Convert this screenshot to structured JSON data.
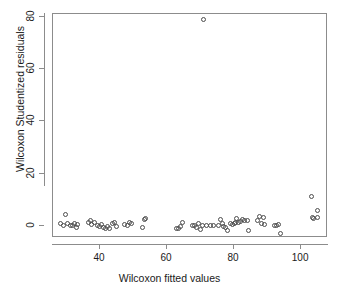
{
  "chart_data": {
    "type": "scatter",
    "title": "",
    "xlabel": "Wilcoxon fitted values",
    "ylabel": "Wilcoxon Studentized residuals",
    "xlim": [
      26,
      108
    ],
    "ylim": [
      -4.5,
      81
    ],
    "xticks": [
      40,
      60,
      80,
      100
    ],
    "yticks": [
      0,
      20,
      40,
      60,
      80
    ],
    "grid": false,
    "legend": null,
    "marker": "open-circle",
    "marker_color": "#4d4d4d",
    "points": [
      [
        28.2,
        0.9
      ],
      [
        29.0,
        0.2
      ],
      [
        29.8,
        4.6
      ],
      [
        30.4,
        1.0
      ],
      [
        31.1,
        0.1
      ],
      [
        31.8,
        0.3
      ],
      [
        32.4,
        1.2
      ],
      [
        32.9,
        -0.5
      ],
      [
        33.4,
        0.5
      ],
      [
        36.6,
        1.4
      ],
      [
        37.1,
        2.3
      ],
      [
        37.6,
        0.6
      ],
      [
        38.4,
        1.3
      ],
      [
        39.2,
        0.4
      ],
      [
        39.9,
        0.0
      ],
      [
        40.5,
        0.8
      ],
      [
        41.1,
        -0.6
      ],
      [
        41.7,
        -0.9
      ],
      [
        42.3,
        -0.2
      ],
      [
        42.9,
        -0.7
      ],
      [
        43.6,
        1.1
      ],
      [
        44.2,
        1.5
      ],
      [
        44.8,
        -0.2
      ],
      [
        47.3,
        0.5
      ],
      [
        48.1,
        0.1
      ],
      [
        48.9,
        1.3
      ],
      [
        49.4,
        1.2
      ],
      [
        52.7,
        -0.4
      ],
      [
        53.4,
        2.4
      ],
      [
        53.7,
        3.1
      ],
      [
        62.8,
        -0.7
      ],
      [
        63.3,
        -0.8
      ],
      [
        64.1,
        0.0
      ],
      [
        64.6,
        1.6
      ],
      [
        67.7,
        0.3
      ],
      [
        68.3,
        0.1
      ],
      [
        68.9,
        -0.5
      ],
      [
        69.4,
        1.0
      ],
      [
        70.0,
        -1.2
      ],
      [
        70.6,
        0.4
      ],
      [
        70.9,
        79.0
      ],
      [
        71.8,
        0.2
      ],
      [
        72.9,
        0.3
      ],
      [
        74.0,
        0.2
      ],
      [
        75.3,
        0.1
      ],
      [
        75.9,
        2.5
      ],
      [
        76.4,
        1.0
      ],
      [
        76.9,
        -0.1
      ],
      [
        77.4,
        -0.3
      ],
      [
        77.9,
        -1.6
      ],
      [
        79.0,
        1.0
      ],
      [
        79.6,
        0.8
      ],
      [
        80.1,
        1.2
      ],
      [
        80.4,
        1.4
      ],
      [
        80.8,
        3.0
      ],
      [
        81.3,
        1.6
      ],
      [
        82.0,
        1.9
      ],
      [
        82.6,
        2.6
      ],
      [
        83.1,
        2.2
      ],
      [
        83.9,
        2.3
      ],
      [
        84.2,
        -1.7
      ],
      [
        87.1,
        2.2
      ],
      [
        87.6,
        3.6
      ],
      [
        88.2,
        1.1
      ],
      [
        88.7,
        3.4
      ],
      [
        89.0,
        0.6
      ],
      [
        92.0,
        0.2
      ],
      [
        92.5,
        0.1
      ],
      [
        93.2,
        0.5
      ],
      [
        93.8,
        -2.9
      ],
      [
        103.0,
        11.2
      ],
      [
        103.4,
        3.3
      ],
      [
        103.6,
        2.9
      ],
      [
        104.8,
        6.0
      ],
      [
        105.0,
        3.2
      ]
    ]
  }
}
